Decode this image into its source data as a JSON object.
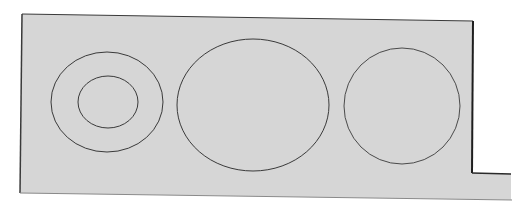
{
  "diagram": {
    "colors": {
      "background": "#ffffff",
      "plate_fill": "#d6d6d6",
      "outline": "#2a2a2a",
      "bottom_edge": "#8a8a8a",
      "shape_stroke": "#3a3a3a"
    },
    "plate": {
      "points": "22,14 473,21 472,173 511,174 511,200 20,193",
      "notch": {
        "x": 472,
        "y": 173,
        "to_x": 511
      }
    },
    "shapes": [
      {
        "name": "left-outer-ellipse",
        "cx": 107,
        "cy": 102,
        "rx": 56,
        "ry": 50
      },
      {
        "name": "left-inner-ellipse",
        "cx": 108,
        "cy": 102,
        "rx": 30,
        "ry": 26
      },
      {
        "name": "middle-ellipse",
        "cx": 253,
        "cy": 105,
        "rx": 76,
        "ry": 66
      },
      {
        "name": "right-circle",
        "cx": 402,
        "cy": 106,
        "rx": 58,
        "ry": 58
      }
    ]
  }
}
